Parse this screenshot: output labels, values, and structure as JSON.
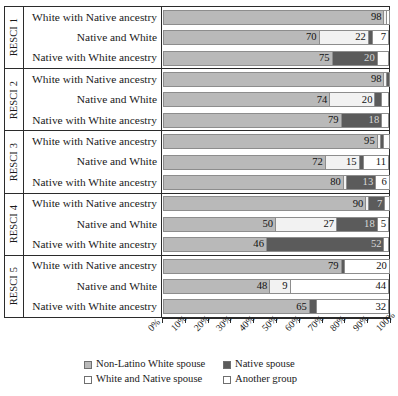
{
  "chart_data": {
    "type": "bar",
    "orientation": "horizontal",
    "stacked": true,
    "percent_stacked": true,
    "title": "",
    "xlabel": "",
    "ylabel": "",
    "xlim": [
      0,
      100
    ],
    "xticks": [
      "0%",
      "10%",
      "20%",
      "30%",
      "40%",
      "50%",
      "60%",
      "70%",
      "80%",
      "90%",
      "100%"
    ],
    "grid": false,
    "legend_position": "bottom",
    "series": [
      {
        "name": "Non-Latino White spouse",
        "key": "white_spouse",
        "color": "#b9b9b9"
      },
      {
        "name": "White and Native spouse",
        "key": "white_native",
        "color": "#f2f2f2"
      },
      {
        "name": "Native spouse",
        "key": "native_spouse",
        "color": "#5b5b5b"
      },
      {
        "name": "Another group",
        "key": "another_group",
        "color": "#ffffff"
      }
    ],
    "groups": [
      {
        "label": "RESCI 1",
        "rows": [
          {
            "label": "White with Native ancestry",
            "segments": [
              {
                "series": "white_spouse",
                "value": 98,
                "show_label": true
              },
              {
                "series": "white_native",
                "value": 1,
                "show_label": false
              },
              {
                "series": "native_spouse",
                "value": 0,
                "show_label": false
              },
              {
                "series": "another_group",
                "value": 1,
                "show_label": false
              }
            ]
          },
          {
            "label": "Native and White",
            "segments": [
              {
                "series": "white_spouse",
                "value": 70,
                "show_label": true
              },
              {
                "series": "white_native",
                "value": 22,
                "show_label": true
              },
              {
                "series": "native_spouse",
                "value": 2,
                "show_label": false
              },
              {
                "series": "another_group",
                "value": 7,
                "show_label": true
              }
            ]
          },
          {
            "label": "Native with White ancestry",
            "segments": [
              {
                "series": "white_spouse",
                "value": 75,
                "show_label": true
              },
              {
                "series": "white_native",
                "value": 0,
                "show_label": false
              },
              {
                "series": "native_spouse",
                "value": 20,
                "show_label": true
              },
              {
                "series": "another_group",
                "value": 5,
                "show_label": false
              }
            ]
          }
        ]
      },
      {
        "label": "RESCI 2",
        "rows": [
          {
            "label": "White with Native ancestry",
            "segments": [
              {
                "series": "white_spouse",
                "value": 98,
                "show_label": true
              },
              {
                "series": "white_native",
                "value": 1,
                "show_label": false
              },
              {
                "series": "native_spouse",
                "value": 1,
                "show_label": false
              },
              {
                "series": "another_group",
                "value": 0,
                "show_label": false
              }
            ]
          },
          {
            "label": "Native and White",
            "segments": [
              {
                "series": "white_spouse",
                "value": 74,
                "show_label": true
              },
              {
                "series": "white_native",
                "value": 20,
                "show_label": true
              },
              {
                "series": "native_spouse",
                "value": 3,
                "show_label": false
              },
              {
                "series": "another_group",
                "value": 3,
                "show_label": false
              }
            ]
          },
          {
            "label": "Native with White ancestry",
            "segments": [
              {
                "series": "white_spouse",
                "value": 79,
                "show_label": true
              },
              {
                "series": "white_native",
                "value": 0,
                "show_label": false
              },
              {
                "series": "native_spouse",
                "value": 18,
                "show_label": true
              },
              {
                "series": "another_group",
                "value": 3,
                "show_label": false
              }
            ]
          }
        ]
      },
      {
        "label": "RESCI 3",
        "rows": [
          {
            "label": "White with Native ancestry",
            "segments": [
              {
                "series": "white_spouse",
                "value": 95,
                "show_label": true
              },
              {
                "series": "white_native",
                "value": 1,
                "show_label": false
              },
              {
                "series": "native_spouse",
                "value": 1,
                "show_label": false
              },
              {
                "series": "another_group",
                "value": 3,
                "show_label": false
              }
            ]
          },
          {
            "label": "Native and White",
            "segments": [
              {
                "series": "white_spouse",
                "value": 72,
                "show_label": true
              },
              {
                "series": "white_native",
                "value": 15,
                "show_label": true
              },
              {
                "series": "native_spouse",
                "value": 2,
                "show_label": false
              },
              {
                "series": "another_group",
                "value": 11,
                "show_label": true
              }
            ]
          },
          {
            "label": "Native with White ancestry",
            "segments": [
              {
                "series": "white_spouse",
                "value": 80,
                "show_label": true
              },
              {
                "series": "white_native",
                "value": 1,
                "show_label": false
              },
              {
                "series": "native_spouse",
                "value": 13,
                "show_label": true
              },
              {
                "series": "another_group",
                "value": 6,
                "show_label": true
              }
            ]
          }
        ]
      },
      {
        "label": "RESCI 4",
        "rows": [
          {
            "label": "White with Native ancestry",
            "segments": [
              {
                "series": "white_spouse",
                "value": 90,
                "show_label": true
              },
              {
                "series": "white_native",
                "value": 1,
                "show_label": false
              },
              {
                "series": "native_spouse",
                "value": 7,
                "show_label": true
              },
              {
                "series": "another_group",
                "value": 2,
                "show_label": false
              }
            ]
          },
          {
            "label": "Native and White",
            "segments": [
              {
                "series": "white_spouse",
                "value": 50,
                "show_label": true
              },
              {
                "series": "white_native",
                "value": 27,
                "show_label": true
              },
              {
                "series": "native_spouse",
                "value": 18,
                "show_label": true
              },
              {
                "series": "another_group",
                "value": 5,
                "show_label": true
              }
            ]
          },
          {
            "label": "Native with White ancestry",
            "segments": [
              {
                "series": "white_spouse",
                "value": 46,
                "show_label": true
              },
              {
                "series": "white_native",
                "value": 0,
                "show_label": false
              },
              {
                "series": "native_spouse",
                "value": 52,
                "show_label": true
              },
              {
                "series": "another_group",
                "value": 2,
                "show_label": false
              }
            ]
          }
        ]
      },
      {
        "label": "RESCI 5",
        "rows": [
          {
            "label": "White with Native ancestry",
            "segments": [
              {
                "series": "white_spouse",
                "value": 79,
                "show_label": true
              },
              {
                "series": "white_native",
                "value": 0,
                "show_label": false
              },
              {
                "series": "native_spouse",
                "value": 1,
                "show_label": false
              },
              {
                "series": "another_group",
                "value": 20,
                "show_label": true
              }
            ]
          },
          {
            "label": "Native and White",
            "segments": [
              {
                "series": "white_spouse",
                "value": 48,
                "show_label": true
              },
              {
                "series": "white_native",
                "value": 9,
                "show_label": true
              },
              {
                "series": "native_spouse",
                "value": 0,
                "show_label": false
              },
              {
                "series": "another_group",
                "value": 44,
                "show_label": true
              }
            ]
          },
          {
            "label": "Native with White ancestry",
            "segments": [
              {
                "series": "white_spouse",
                "value": 65,
                "show_label": true
              },
              {
                "series": "white_native",
                "value": 0,
                "show_label": false
              },
              {
                "series": "native_spouse",
                "value": 3,
                "show_label": false
              },
              {
                "series": "another_group",
                "value": 32,
                "show_label": true
              }
            ]
          }
        ]
      }
    ]
  }
}
